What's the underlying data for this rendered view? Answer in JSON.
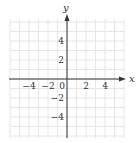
{
  "chart_data": {
    "type": "scatter",
    "title": "",
    "xlabel": "x",
    "ylabel": "y",
    "xlim": [
      -6,
      6
    ],
    "ylim": [
      -6,
      6
    ],
    "grid": true,
    "x_ticks": [
      -4,
      -2,
      0,
      2,
      4
    ],
    "y_ticks": [
      4,
      2,
      -2,
      -4
    ],
    "x_tick_labels": [
      "−4",
      "−2",
      "0",
      "2",
      "4"
    ],
    "y_tick_labels": [
      "4",
      "2",
      "−2",
      "−4"
    ],
    "series": []
  },
  "colors": {
    "grid": "#e6e6e6",
    "axis": "#333333",
    "text": "#333333"
  }
}
